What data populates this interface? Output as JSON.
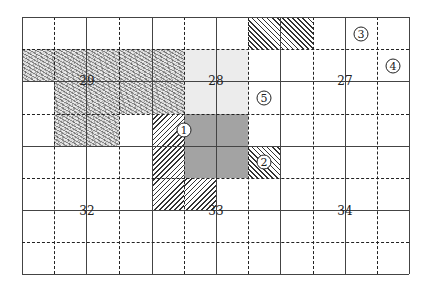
{
  "grid": {
    "left": 22,
    "top": 17,
    "right": 409,
    "bottom": 274,
    "vlines": [
      {
        "x": 22,
        "style": "solid"
      },
      {
        "x": 54,
        "style": "dashed"
      },
      {
        "x": 86,
        "style": "solid"
      },
      {
        "x": 119,
        "style": "dashed"
      },
      {
        "x": 152,
        "style": "solid"
      },
      {
        "x": 184,
        "style": "dashed"
      },
      {
        "x": 216,
        "style": "solid"
      },
      {
        "x": 248,
        "style": "dashed"
      },
      {
        "x": 280,
        "style": "solid"
      },
      {
        "x": 313,
        "style": "dashed"
      },
      {
        "x": 345,
        "style": "solid"
      },
      {
        "x": 377,
        "style": "dashed"
      },
      {
        "x": 409,
        "style": "solid"
      }
    ],
    "hlines": [
      {
        "y": 17,
        "style": "solid"
      },
      {
        "y": 49,
        "style": "dashed"
      },
      {
        "y": 81,
        "style": "solid"
      },
      {
        "y": 114,
        "style": "dashed"
      },
      {
        "y": 146,
        "style": "solid"
      },
      {
        "y": 178,
        "style": "dashed"
      },
      {
        "y": 210,
        "style": "solid"
      },
      {
        "y": 242,
        "style": "dashed"
      },
      {
        "y": 274,
        "style": "solid"
      }
    ]
  },
  "regions": [
    {
      "name": "stipple-region-29-row1",
      "type": "stipple",
      "x": 22,
      "y": 49,
      "w": 162,
      "h": 32
    },
    {
      "name": "stipple-region-29-row2",
      "type": "stipple",
      "x": 54,
      "y": 81,
      "w": 130,
      "h": 33
    },
    {
      "name": "stipple-region-29-row3",
      "type": "stipple",
      "x": 54,
      "y": 114,
      "w": 65,
      "h": 32
    },
    {
      "name": "light-gray-region-28",
      "type": "light",
      "x": 184,
      "y": 49,
      "w": 64,
      "h": 65
    },
    {
      "name": "dark-gray-region",
      "type": "dark",
      "x": 184,
      "y": 114,
      "w": 64,
      "h": 64
    },
    {
      "name": "hatched-region-1-col",
      "type": "hatch-fwd",
      "x": 152,
      "y": 114,
      "w": 32,
      "h": 96
    },
    {
      "name": "hatched-region-1-foot",
      "type": "hatch-fwd",
      "x": 184,
      "y": 178,
      "w": 32,
      "h": 32
    },
    {
      "name": "hatched-region-2",
      "type": "hatch-back",
      "x": 248,
      "y": 146,
      "w": 32,
      "h": 32
    },
    {
      "name": "hatched-region-top",
      "type": "hatch-back",
      "x": 248,
      "y": 17,
      "w": 65,
      "h": 32
    }
  ],
  "labels": [
    {
      "name": "label-29",
      "text": "29",
      "x": 87,
      "y": 81
    },
    {
      "name": "label-28",
      "text": "28",
      "x": 216,
      "y": 81
    },
    {
      "name": "label-27",
      "text": "27",
      "x": 345,
      "y": 81
    },
    {
      "name": "label-32",
      "text": "32",
      "x": 87,
      "y": 211
    },
    {
      "name": "label-33",
      "text": "33",
      "x": 216,
      "y": 211
    },
    {
      "name": "label-34",
      "text": "34",
      "x": 345,
      "y": 211
    }
  ],
  "markers": [
    {
      "name": "marker-1",
      "text": "1",
      "x": 184,
      "y": 130
    },
    {
      "name": "marker-2",
      "text": "2",
      "x": 264,
      "y": 162
    },
    {
      "name": "marker-3",
      "text": "3",
      "x": 361,
      "y": 34
    },
    {
      "name": "marker-4",
      "text": "4",
      "x": 393,
      "y": 66
    },
    {
      "name": "marker-5",
      "text": "5",
      "x": 264,
      "y": 98
    }
  ]
}
